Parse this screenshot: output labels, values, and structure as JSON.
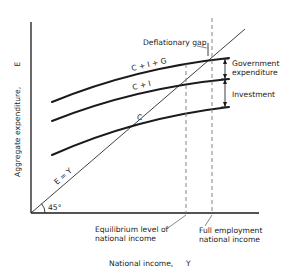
{
  "figure": {
    "type": "keynesian-cross-diagram",
    "title": "Deflationary gap"
  },
  "axes": {
    "y_label": "Aggregate expenditure,",
    "y_symbol": "E",
    "x_label": "National income,",
    "x_symbol": "Y",
    "angle_label": "45°"
  },
  "lines": {
    "forty_five": {
      "label": "E = Y"
    },
    "c": {
      "label": "C"
    },
    "ci": {
      "label": "C + I"
    },
    "cig": {
      "label": "C + I + G"
    }
  },
  "annotations": {
    "deflationary_gap": "Deflationary gap",
    "gov_exp_line1": "Government",
    "gov_exp_line2": "expenditure",
    "investment": "Investment",
    "equilibrium_line1": "Equilibrium level of",
    "equilibrium_line2": "national income",
    "full_emp_line1": "Full employment",
    "full_emp_line2": "national income"
  },
  "colors": {
    "ink": "#1a1a1a",
    "dashed": "#777777",
    "background": "#ffffff"
  }
}
